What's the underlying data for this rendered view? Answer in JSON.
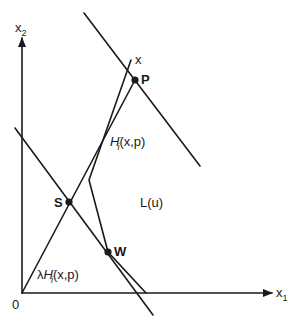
{
  "diagram": {
    "axes": {
      "x_label": "x",
      "x_sub": "1",
      "y_label": "x",
      "y_sub": "2",
      "origin_label": "0"
    },
    "points": {
      "P": "P",
      "S": "S",
      "W": "W",
      "x": "x"
    },
    "region_label": "L(u)",
    "ray_label_upper": {
      "H": "H",
      "sup": "-",
      "sub": "i",
      "args": "(x,p)"
    },
    "ray_label_lower": {
      "lambda": "λ",
      "H": "H",
      "sup": "-",
      "sub": "i",
      "args": "(x,p)"
    },
    "colors": {
      "ink": "#1a1a1a",
      "background": "#ffffff"
    }
  }
}
